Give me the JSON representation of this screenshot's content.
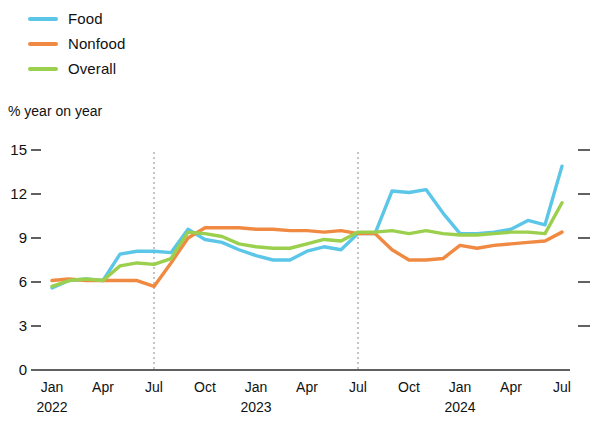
{
  "legend": {
    "position": "top-left",
    "items": [
      {
        "label": "Food",
        "color": "#5BC6E8",
        "key": "food"
      },
      {
        "label": "Nonfood",
        "color": "#F08A42",
        "key": "nonfood"
      },
      {
        "label": "Overall",
        "color": "#9BD04E",
        "key": "overall"
      }
    ]
  },
  "axis": {
    "y_title": "% year on year",
    "y_ticks": [
      "15",
      "12",
      "9",
      "6",
      "3",
      "0"
    ],
    "x_tick_labels": [
      "Jan",
      "Apr",
      "Jul",
      "Oct",
      "Jan",
      "Apr",
      "Jul",
      "Oct",
      "Jan",
      "Apr",
      "Jul"
    ],
    "x_year_labels": [
      "2022",
      "2023",
      "2024"
    ]
  },
  "chart_data": {
    "type": "line",
    "title": "",
    "subtitle": "",
    "xlabel": "",
    "ylabel": "% year on year",
    "ylim": [
      0,
      15
    ],
    "ytick_values": [
      0,
      3,
      6,
      9,
      12,
      15
    ],
    "grid": false,
    "legend_position": "top-left",
    "annotations": [
      {
        "type": "vertical-dashed-line",
        "x": "Jul 2022"
      },
      {
        "type": "vertical-dashed-line",
        "x": "Jul 2023"
      }
    ],
    "x": [
      "Jan 2022",
      "Feb 2022",
      "Mar 2022",
      "Apr 2022",
      "May 2022",
      "Jun 2022",
      "Jul 2022",
      "Aug 2022",
      "Sep 2022",
      "Oct 2022",
      "Nov 2022",
      "Dec 2022",
      "Jan 2023",
      "Feb 2023",
      "Mar 2023",
      "Apr 2023",
      "May 2023",
      "Jun 2023",
      "Jul 2023",
      "Aug 2023",
      "Sep 2023",
      "Oct 2023",
      "Nov 2023",
      "Dec 2023",
      "Jan 2024",
      "Feb 2024",
      "Mar 2024",
      "Apr 2024",
      "May 2024",
      "Jun 2024",
      "Jul 2024"
    ],
    "x_tick_labels": [
      "Jan",
      "Apr",
      "Jul",
      "Oct",
      "Jan",
      "Apr",
      "Jul",
      "Oct",
      "Jan",
      "Apr",
      "Jul"
    ],
    "x_tick_years": [
      "2022",
      "",
      "",
      "",
      "2023",
      "",
      "",
      "",
      "2024",
      "",
      ""
    ],
    "series": [
      {
        "name": "Food",
        "color": "#5BC6E8",
        "values": [
          5.6,
          6.1,
          6.2,
          6.1,
          7.9,
          8.1,
          8.1,
          8.0,
          9.6,
          8.9,
          8.7,
          8.2,
          7.8,
          7.5,
          7.5,
          8.1,
          8.4,
          8.2,
          9.3,
          9.3,
          12.2,
          12.1,
          12.3,
          10.7,
          9.3,
          9.3,
          9.4,
          9.6,
          10.2,
          9.9,
          13.9
        ]
      },
      {
        "name": "Nonfood",
        "color": "#F08A42",
        "values": [
          6.1,
          6.2,
          6.1,
          6.1,
          6.1,
          6.1,
          5.7,
          7.3,
          9.0,
          9.7,
          9.7,
          9.7,
          9.6,
          9.6,
          9.5,
          9.5,
          9.4,
          9.5,
          9.3,
          9.3,
          8.2,
          7.5,
          7.5,
          7.6,
          8.5,
          8.3,
          8.5,
          8.6,
          8.7,
          8.8,
          9.4
        ]
      },
      {
        "name": "Overall",
        "color": "#9BD04E",
        "values": [
          5.7,
          6.1,
          6.2,
          6.1,
          7.1,
          7.3,
          7.2,
          7.6,
          9.4,
          9.3,
          9.1,
          8.6,
          8.4,
          8.3,
          8.3,
          8.6,
          8.9,
          8.8,
          9.4,
          9.4,
          9.5,
          9.3,
          9.5,
          9.3,
          9.2,
          9.2,
          9.3,
          9.4,
          9.4,
          9.3,
          11.4
        ]
      }
    ]
  }
}
